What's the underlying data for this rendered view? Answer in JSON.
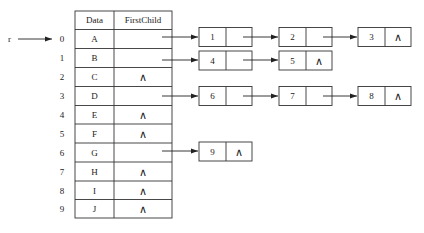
{
  "diagram": {
    "pointer_label": "r",
    "table": {
      "headers": [
        "Data",
        "FirstChild"
      ],
      "rows": [
        {
          "index": "0",
          "data": "A",
          "first_child": ""
        },
        {
          "index": "1",
          "data": "B",
          "first_child": ""
        },
        {
          "index": "2",
          "data": "C",
          "first_child": "∧"
        },
        {
          "index": "3",
          "data": "D",
          "first_child": ""
        },
        {
          "index": "4",
          "data": "E",
          "first_child": "∧"
        },
        {
          "index": "5",
          "data": "F",
          "first_child": "∧"
        },
        {
          "index": "6",
          "data": "G",
          "first_child": ""
        },
        {
          "index": "7",
          "data": "H",
          "first_child": "∧"
        },
        {
          "index": "8",
          "data": "I",
          "first_child": "∧"
        },
        {
          "index": "9",
          "data": "J",
          "first_child": "∧"
        }
      ]
    },
    "child_lists": [
      {
        "row": "0",
        "nodes": [
          {
            "value": "1",
            "next": ""
          },
          {
            "value": "2",
            "next": ""
          },
          {
            "value": "3",
            "next": "∧"
          }
        ]
      },
      {
        "row": "1",
        "nodes": [
          {
            "value": "4",
            "next": ""
          },
          {
            "value": "5",
            "next": "∧"
          }
        ]
      },
      {
        "row": "3",
        "nodes": [
          {
            "value": "6",
            "next": ""
          },
          {
            "value": "7",
            "next": ""
          },
          {
            "value": "8",
            "next": "∧"
          }
        ]
      },
      {
        "row": "6",
        "nodes": [
          {
            "value": "9",
            "next": "∧"
          }
        ]
      }
    ]
  }
}
